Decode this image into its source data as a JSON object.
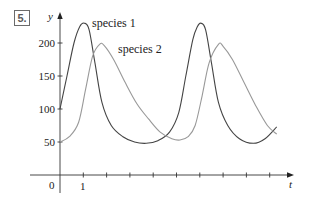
{
  "problem": {
    "number": "5."
  },
  "chart_data": {
    "type": "line",
    "title": "",
    "xlabel": "t",
    "ylabel": "y",
    "xlim": [
      0,
      10
    ],
    "ylim": [
      0,
      240
    ],
    "x_ticks": [
      1,
      2,
      3,
      4,
      5,
      6,
      7,
      8,
      9
    ],
    "x_tick_labels": [
      {
        "value": 0,
        "label": "0"
      },
      {
        "value": 1,
        "label": "1"
      }
    ],
    "y_ticks": [
      50,
      100,
      150,
      200
    ],
    "y_tick_labels": [
      "50",
      "100",
      "150",
      "200"
    ],
    "grid": false,
    "legend": "inline labels",
    "series": [
      {
        "name": "species 1",
        "color": "#444444",
        "points": [
          [
            0,
            100
          ],
          [
            0.3,
            150
          ],
          [
            0.6,
            200
          ],
          [
            0.85,
            225
          ],
          [
            1.05,
            230
          ],
          [
            1.25,
            220
          ],
          [
            1.5,
            170
          ],
          [
            1.8,
            110
          ],
          [
            2.2,
            75
          ],
          [
            2.7,
            58
          ],
          [
            3.2,
            50
          ],
          [
            3.7,
            48
          ],
          [
            4.2,
            52
          ],
          [
            4.7,
            65
          ],
          [
            5.1,
            95
          ],
          [
            5.4,
            150
          ],
          [
            5.7,
            205
          ],
          [
            5.9,
            225
          ],
          [
            6.05,
            230
          ],
          [
            6.25,
            220
          ],
          [
            6.5,
            170
          ],
          [
            6.8,
            110
          ],
          [
            7.2,
            75
          ],
          [
            7.7,
            55
          ],
          [
            8.3,
            48
          ],
          [
            8.8,
            55
          ],
          [
            9.3,
            73
          ]
        ]
      },
      {
        "name": "species 2",
        "color": "#999999",
        "points": [
          [
            0,
            50
          ],
          [
            0.4,
            58
          ],
          [
            0.8,
            80
          ],
          [
            1.1,
            130
          ],
          [
            1.4,
            180
          ],
          [
            1.7,
            198
          ],
          [
            1.9,
            196
          ],
          [
            2.3,
            175
          ],
          [
            2.8,
            140
          ],
          [
            3.3,
            108
          ],
          [
            3.8,
            85
          ],
          [
            4.3,
            65
          ],
          [
            4.8,
            55
          ],
          [
            5.15,
            53
          ],
          [
            5.5,
            58
          ],
          [
            5.8,
            75
          ],
          [
            6.1,
            120
          ],
          [
            6.4,
            170
          ],
          [
            6.8,
            198
          ],
          [
            7.0,
            195
          ],
          [
            7.4,
            175
          ],
          [
            7.9,
            140
          ],
          [
            8.4,
            105
          ],
          [
            8.9,
            75
          ],
          [
            9.3,
            62
          ]
        ]
      }
    ],
    "annotations": [
      {
        "text": "species 1",
        "x": 1.35,
        "y": 225
      },
      {
        "text": "species 2",
        "x": 2.5,
        "y": 186
      }
    ]
  }
}
